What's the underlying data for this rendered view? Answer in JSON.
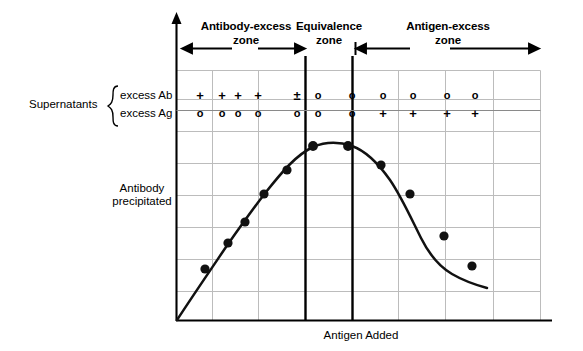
{
  "figure": {
    "title_x_axis": "Antigen  Added",
    "title_y_axis_line1": "Antibody",
    "title_y_axis_line2": "precipitated"
  },
  "zones": [
    {
      "name": "antibody-excess",
      "label_line1": "Antibody-excess",
      "label_line2": "zone"
    },
    {
      "name": "equivalence",
      "label_line1": "Equivalence",
      "label_line2": "zone"
    },
    {
      "name": "antigen-excess",
      "label_line1": "Antigen-excess",
      "label_line2": "zone"
    }
  ],
  "supernatants": {
    "group_label": "Supernatants",
    "rows": [
      {
        "label": "excess Ab",
        "values": [
          "+",
          "+",
          "+",
          "+",
          "±",
          "o",
          "o",
          "o",
          "o",
          "o",
          "o"
        ]
      },
      {
        "label": "excess Ag",
        "values": [
          "o",
          "o",
          "o",
          "o",
          "o",
          "o",
          "o",
          "+",
          "+",
          "+",
          "+"
        ]
      }
    ],
    "column_x": [
      200,
      222,
      238,
      258,
      297,
      318,
      352,
      383,
      413,
      447,
      475
    ]
  },
  "chart_data": {
    "type": "line",
    "title": "",
    "xlabel": "Antigen  Added",
    "ylabel": "Antibody precipitated",
    "grid": true,
    "legend": "none",
    "xlim": [
      0,
      10
    ],
    "ylim": [
      0,
      10
    ],
    "axis_ticks_labeled": false,
    "series": [
      {
        "name": "Antibody precipitated",
        "marker": "filled-circle",
        "points": [
          {
            "x": 0.0,
            "y": 0.0
          },
          {
            "x": 1.35,
            "y": 2.15
          },
          {
            "x": 2.25,
            "y": 3.55
          },
          {
            "x": 2.9,
            "y": 4.55
          },
          {
            "x": 3.6,
            "y": 5.65
          },
          {
            "x": 4.4,
            "y": 6.75
          },
          {
            "x": 5.3,
            "y": 7.55
          },
          {
            "x": 6.4,
            "y": 7.55
          },
          {
            "x": 7.25,
            "y": 7.1
          },
          {
            "x": 8.05,
            "y": 6.0
          },
          {
            "x": 8.85,
            "y": 4.4
          },
          {
            "x": 9.55,
            "y": 3.3
          }
        ]
      }
    ],
    "zone_boundaries": [
      5.75,
      6.95
    ],
    "vertical_gridlines_x": [
      0,
      1.0,
      2.25,
      3.5,
      5.75,
      6.95,
      8.0,
      9.25,
      10.0
    ],
    "horizontal_gridlines_y": [
      1.1,
      2.35,
      3.6,
      4.85,
      6.1,
      7.35,
      8.6
    ]
  },
  "colors": {
    "ink": "#000000",
    "grid": "#b9b9b9",
    "background": "#ffffff"
  }
}
